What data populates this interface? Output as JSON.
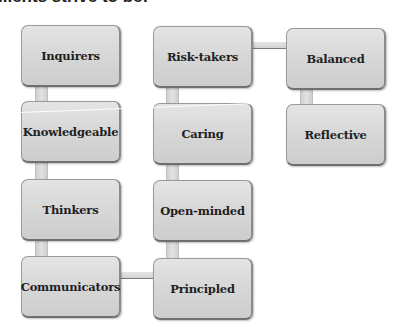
{
  "caption": "...ents strive to be:",
  "diagram": {
    "type": "connected-boxes",
    "columns": [
      [
        "Inquirers",
        "Knowledgeable",
        "Thinkers",
        "Communicators"
      ],
      [
        "Risk-takers",
        "Caring",
        "Open-minded",
        "Principled"
      ],
      [
        "Balanced",
        "Reflective"
      ]
    ],
    "nodes": {
      "inquirers": "Inquirers",
      "knowledgeable": "Knowledgeable",
      "thinkers": "Thinkers",
      "communicators": "Communicators",
      "risk_takers": "Risk-takers",
      "caring": "Caring",
      "open_minded": "Open-minded",
      "principled": "Principled",
      "balanced": "Balanced",
      "reflective": "Reflective"
    },
    "flow_order": [
      "Inquirers",
      "Knowledgeable",
      "Thinkers",
      "Communicators",
      "Principled",
      "Open-minded",
      "Caring",
      "Risk-takers",
      "Balanced",
      "Reflective"
    ],
    "colors": {
      "box_fill": "#d8d8d8",
      "box_border": "#6f6f6f",
      "text": "#1f1f1f",
      "connector": "#d6d6d6"
    }
  }
}
